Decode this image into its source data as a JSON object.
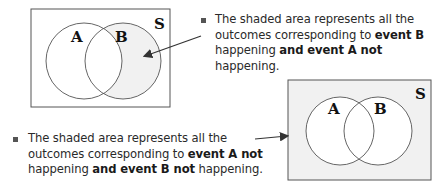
{
  "diagram1": {
    "universe_label": "S",
    "set_a_label": "A",
    "set_b_label": "B",
    "shaded_region": "B and not A",
    "caption": {
      "t1": "The shaded area represents all the",
      "t2": "outcomes corresponding to ",
      "b1": "event B",
      "t3": "happening ",
      "b2": "and event A not",
      "t4": " happening."
    }
  },
  "diagram2": {
    "universe_label": "S",
    "set_a_label": "A",
    "set_b_label": "B",
    "shaded_region": "not A and not B",
    "caption": {
      "t1": "The shaded area represents all the",
      "t2": "outcomes corresponding to ",
      "b1": "event A not",
      "t3": "happening ",
      "b2": "and event B not",
      "t4": " happening."
    }
  },
  "colors": {
    "shade": "#f1f1f1",
    "line": "#555555"
  }
}
